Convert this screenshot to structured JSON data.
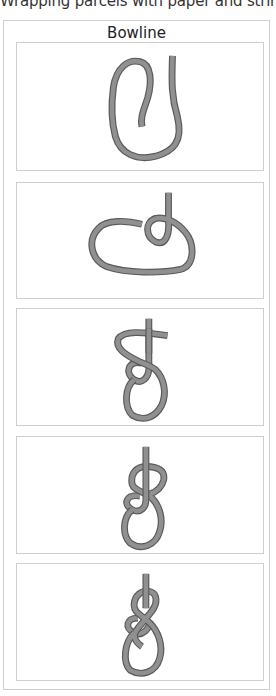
{
  "header": {
    "caption_cropped": "Wrapping parcels with paper and string and tying"
  },
  "figure": {
    "title": "Bowline",
    "colors": {
      "border": "#cfcfcf",
      "rope_fill": "#909090",
      "rope_outline": "#5a5a5a"
    },
    "steps": [
      {
        "step": 1,
        "description": "rope doubled into a long U-loop",
        "icon": "rope-loop-step-1"
      },
      {
        "step": 2,
        "description": "small overhand loop formed in standing part",
        "icon": "rope-loop-step-2"
      },
      {
        "step": 3,
        "description": "working end passed up through small loop",
        "icon": "rope-loop-step-3"
      },
      {
        "step": 4,
        "description": "working end passed behind standing part",
        "icon": "rope-loop-step-4"
      },
      {
        "step": 5,
        "description": "working end back down through small loop, knot tightened",
        "icon": "rope-loop-step-5"
      }
    ]
  }
}
